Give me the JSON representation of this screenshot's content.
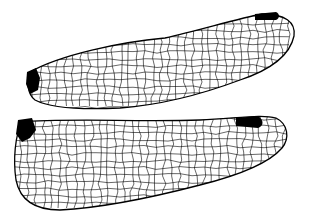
{
  "figure": {
    "wings": [
      {
        "name": "forewing",
        "pterostigma": true
      },
      {
        "name": "hindwing",
        "pterostigma": true
      }
    ],
    "colors": {
      "vein": "#000000",
      "background": "#ffffff",
      "membrane": "#ffffff"
    }
  }
}
